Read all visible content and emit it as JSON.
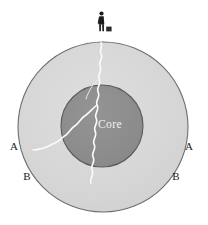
{
  "figure": {
    "name": "planet-cross-section",
    "background_color": "#ffffff",
    "width": 208,
    "height": 225
  },
  "layers": {
    "outer": {
      "name": "mantle",
      "fill_color": "#d6d6d6",
      "stroke_color": "#6e6e6e",
      "center_x": 103,
      "center_y": 127,
      "radius": 85
    },
    "inner": {
      "name": "core",
      "label": "Core",
      "label_color": "#f2f2f2",
      "fill_color": "#8c8c8c",
      "stroke_color": "#5a5a5a",
      "center_x": 102,
      "center_y": 126,
      "radius": 41
    }
  },
  "figure_person": {
    "label": "observer",
    "color": "#1c1c1c",
    "x": 101,
    "y": 12,
    "height": 19,
    "case_label": "case",
    "case_color": "#2a2a2a"
  },
  "fracture": {
    "label": "fracture",
    "color": "#fbfbfb",
    "stroke_width": 1.6,
    "branches": 2
  },
  "labels": [
    {
      "id": "label-a-left",
      "text": "A",
      "x": 14,
      "y": 147
    },
    {
      "id": "label-a-right",
      "text": "A",
      "x": 189,
      "y": 147
    },
    {
      "id": "label-b-left",
      "text": "B",
      "x": 27,
      "y": 177
    },
    {
      "id": "label-b-right",
      "text": "B",
      "x": 176,
      "y": 177
    }
  ]
}
